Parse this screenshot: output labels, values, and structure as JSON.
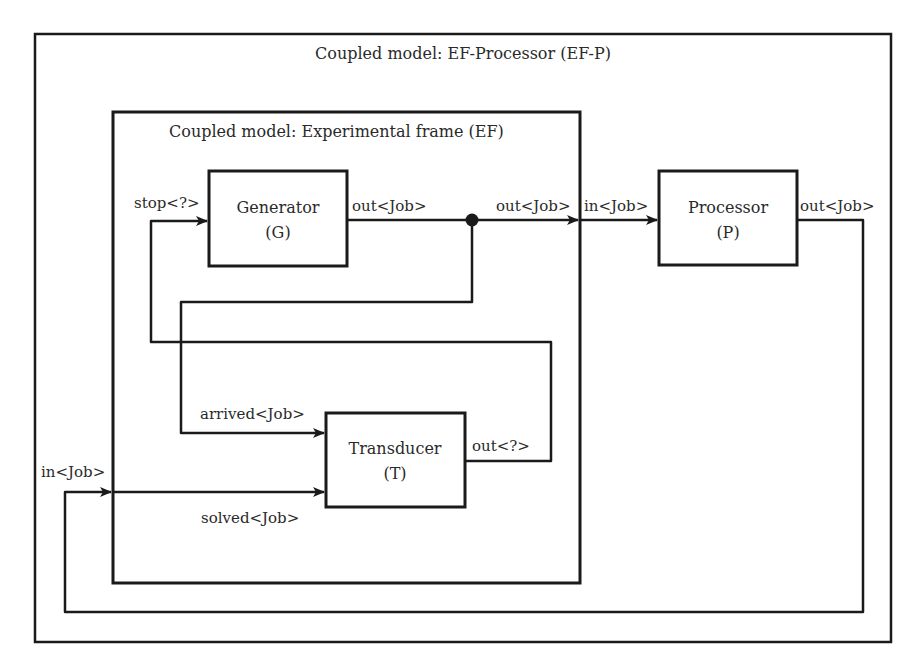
{
  "diagram": {
    "outer": {
      "title": "Coupled model: EF-Processor (EF-P)"
    },
    "ef": {
      "title": "Coupled model: Experimental frame (EF)"
    },
    "blocks": {
      "generator": {
        "name": "Generator",
        "abbr": "(G)"
      },
      "transducer": {
        "name": "Transducer",
        "abbr": "(T)"
      },
      "processor": {
        "name": "Processor",
        "abbr": "(P)"
      }
    },
    "ports": {
      "gen_stop": "stop<?>",
      "gen_out": "out<Job>",
      "ef_out": "out<Job>",
      "proc_in": "in<Job>",
      "proc_out": "out<Job>",
      "trans_arrived": "arrived<Job>",
      "trans_out": "out<?>",
      "ef_in": "in<Job>",
      "trans_solved": "solved<Job>"
    },
    "colors": {
      "line": "#1a1a1a",
      "text": "#2a2a2a",
      "background": "#ffffff"
    }
  }
}
